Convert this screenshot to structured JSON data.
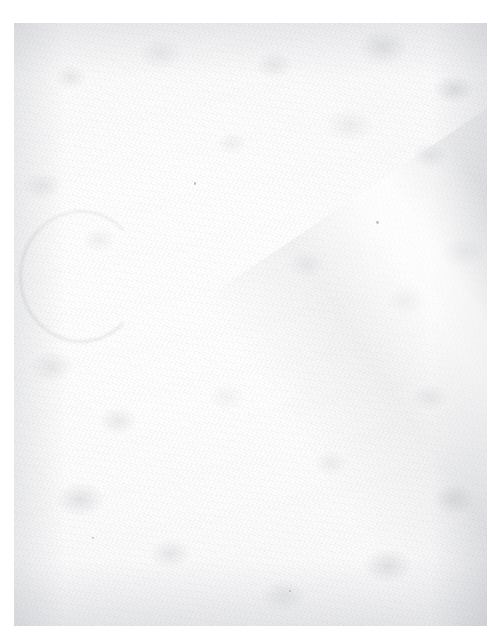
{
  "document": {
    "kind": "scanned-page",
    "content_text": "",
    "visible_text_present": false,
    "page_label": "",
    "page_number": "",
    "header_text": "",
    "footer_text": "",
    "caption": ""
  },
  "canvas": {
    "width_px": 503,
    "height_px": 642,
    "background_color": "#ffffff"
  },
  "sheet": {
    "left_px": 14,
    "top_px": 23,
    "width_px": 473,
    "height_px": 603,
    "paper_color": "#fdfdfd",
    "brightest_color": "#ffffff",
    "grain_color": "#94969c",
    "edge_shade_color": "#8a8d95"
  },
  "artifacts": [
    {
      "name": "paper-grain",
      "description": "fine uniform speckled scanner grain across the whole sheet",
      "color": "#94969c"
    },
    {
      "name": "edge-shading",
      "description": "darker toner accumulation along all four sheet edges",
      "color": "#8a8d95"
    },
    {
      "name": "diagonal-crease",
      "description": "pale diagonal fold band running from mid-sheet to lower-right",
      "color": "#85888f"
    },
    {
      "name": "stain-arc",
      "description": "faint curved ring stain in the mid-left region",
      "color": "#8b8e97"
    },
    {
      "name": "specks",
      "description": "a few isolated dark dust specks",
      "color": "#6a6d77"
    }
  ]
}
